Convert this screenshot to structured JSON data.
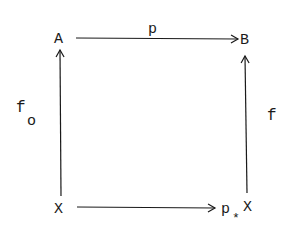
{
  "diagram": {
    "type": "commutative-square",
    "nodes": {
      "top_left": "A",
      "top_right": "B",
      "bottom_left": "X",
      "bottom_right_base": "p",
      "bottom_right_sub": "*",
      "bottom_right_tail": "X"
    },
    "arrows": {
      "top": {
        "from": "A",
        "to": "B",
        "label": "p"
      },
      "left": {
        "from": "X",
        "to": "A",
        "label": "f",
        "label_sub": "o"
      },
      "right": {
        "from": "p_*X",
        "to": "B",
        "label": "f"
      },
      "bottom": {
        "from": "X",
        "to": "p_*X",
        "label": ""
      }
    },
    "colors": {
      "ink": "#1a1a1a",
      "background": "#ffffff"
    }
  }
}
